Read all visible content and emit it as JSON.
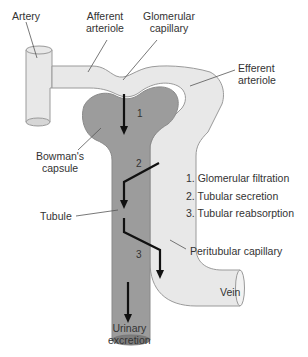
{
  "figure": {
    "colors": {
      "vessel_fill": "#e8e8e8",
      "vessel_stroke": "#9a9a9a",
      "tubule_fill": "#9c9c9c",
      "tubule_dark": "#7d7d7d",
      "arrow": "#111111",
      "text": "#333333"
    }
  },
  "labels": {
    "artery": "Artery",
    "afferent_arteriole": [
      "Afferent",
      "arteriole"
    ],
    "glomerular_capillary": [
      "Glomerular",
      "capillary"
    ],
    "efferent_arteriole": [
      "Efferent",
      "arteriole"
    ],
    "bowmans_capsule": [
      "Bowman's",
      "capsule"
    ],
    "tubule": "Tubule",
    "peritubular_capillary": "Peritubular capillary",
    "vein": "Vein",
    "urinary_excretion": [
      "Urinary",
      "excretion"
    ]
  },
  "arrow_numbers": [
    "1",
    "2",
    "3"
  ],
  "legend": {
    "items": [
      "1. Glomerular filtration",
      "2. Tubular secretion",
      "3. Tubular reabsorption"
    ]
  }
}
